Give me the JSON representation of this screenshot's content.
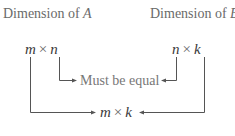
{
  "diagram": {
    "label_a": {
      "prefix": "Dimension of ",
      "matrix": "A"
    },
    "label_b": {
      "prefix": "Dimension of ",
      "matrix": "B"
    },
    "dim_a": {
      "rows": "m",
      "times": "×",
      "cols": "n"
    },
    "dim_b": {
      "rows": "n",
      "times": "×",
      "cols": "k"
    },
    "inner_note": "Must be equal",
    "result": {
      "rows": "m",
      "times": "×",
      "cols": "k"
    },
    "colors": {
      "line": "#555555",
      "text": "#3a3a3a",
      "label": "#6a6a6a"
    }
  }
}
